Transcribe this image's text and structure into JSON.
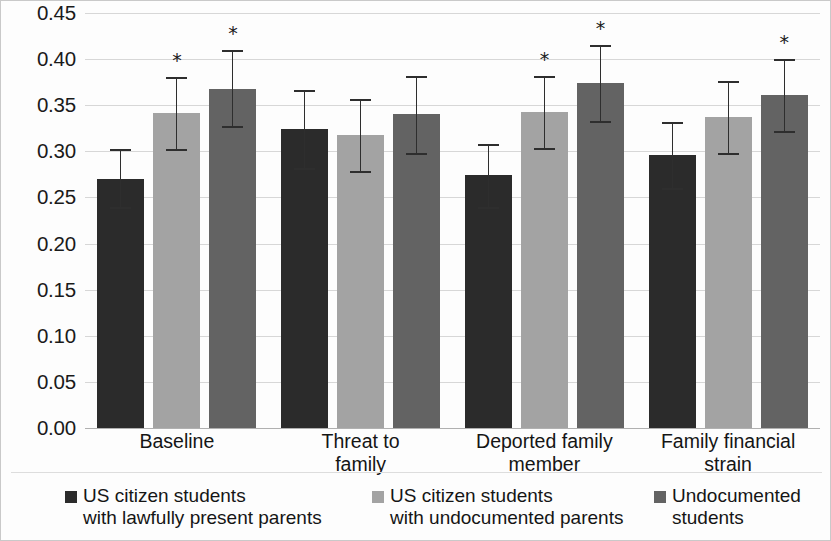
{
  "chart_data": {
    "type": "bar",
    "title": "",
    "subtitle": "",
    "xlabel": "",
    "ylabel": "",
    "ylim": [
      0.0,
      0.45
    ],
    "ytick_step": 0.05,
    "ytick_labels": [
      "0.45",
      "0.40",
      "0.35",
      "0.30",
      "0.25",
      "0.20",
      "0.15",
      "0.10",
      "0.05",
      "0.00"
    ],
    "ytick_values": [
      0.45,
      0.4,
      0.35,
      0.3,
      0.25,
      0.2,
      0.15,
      0.1,
      0.05,
      0.0
    ],
    "grid": true,
    "grid_axis": "y",
    "legend_position": "bottom",
    "error_bars": "95% confidence interval",
    "significance_marker": "*",
    "categories": [
      "Baseline",
      "Threat to family",
      "Deported family member",
      "Family financial strain"
    ],
    "category_label_lines": [
      [
        "Baseline"
      ],
      [
        "Threat to",
        "family"
      ],
      [
        "Deported family",
        "member"
      ],
      [
        "Family financial",
        "strain"
      ]
    ],
    "series": [
      {
        "name": "US citizen students with lawfully present parents",
        "legend_lines": [
          "US citizen students",
          "with lawfully present parents"
        ],
        "color": "#2b2b2b",
        "values": [
          0.27,
          0.324,
          0.274,
          0.296
        ],
        "err_low": [
          0.24,
          0.282,
          0.24,
          0.26
        ],
        "err_high": [
          0.302,
          0.366,
          0.308,
          0.332
        ],
        "significant": [
          false,
          false,
          false,
          false
        ]
      },
      {
        "name": "US citizen students with undocumented parents",
        "legend_lines": [
          "US citizen students",
          "with undocumented parents"
        ],
        "color": "#a3a3a3",
        "values": [
          0.342,
          0.318,
          0.343,
          0.337
        ],
        "err_low": [
          0.303,
          0.279,
          0.304,
          0.298
        ],
        "err_high": [
          0.381,
          0.357,
          0.382,
          0.376
        ],
        "significant": [
          true,
          false,
          true,
          false
        ]
      },
      {
        "name": "Undocumented students",
        "legend_lines": [
          "Undocumented",
          "students"
        ],
        "color": "#636363",
        "values": [
          0.368,
          0.34,
          0.374,
          0.361
        ],
        "err_low": [
          0.327,
          0.298,
          0.333,
          0.322
        ],
        "err_high": [
          0.41,
          0.382,
          0.415,
          0.4
        ],
        "significant": [
          true,
          false,
          true,
          true
        ]
      }
    ]
  }
}
